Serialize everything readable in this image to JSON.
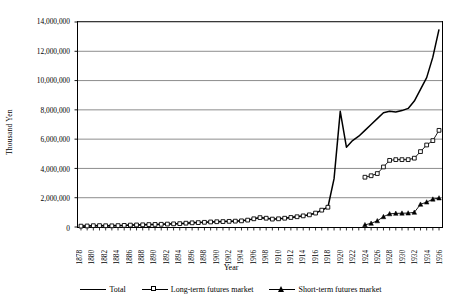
{
  "chart_data": {
    "type": "line",
    "title": "",
    "xlabel": "Year",
    "ylabel": "Thousand Yen",
    "ylim": [
      0,
      14000000
    ],
    "ytick_labels": [
      "0",
      "2,000,000",
      "4,000,000",
      "6,000,000",
      "8,000,000",
      "10,000,000",
      "12,000,000",
      "14,000,000"
    ],
    "ytick_values": [
      0,
      2000000,
      4000000,
      6000000,
      8000000,
      10000000,
      12000000,
      14000000
    ],
    "grid": true,
    "legend_position": "bottom",
    "xlim": [
      1878,
      1937
    ],
    "xtick_labels": [
      "1878",
      "1880",
      "1882",
      "1884",
      "1886",
      "1888",
      "1890",
      "1892",
      "1894",
      "1896",
      "1898",
      "1900",
      "1902",
      "1904",
      "1906",
      "1908",
      "1910",
      "1912",
      "1914",
      "1916",
      "1918",
      "1920",
      "1922",
      "1924",
      "1926",
      "1928",
      "1930",
      "1932",
      "1934",
      "1936"
    ],
    "x": [
      1878,
      1879,
      1880,
      1881,
      1882,
      1883,
      1884,
      1885,
      1886,
      1887,
      1888,
      1889,
      1890,
      1891,
      1892,
      1893,
      1894,
      1895,
      1896,
      1897,
      1898,
      1899,
      1900,
      1901,
      1902,
      1903,
      1904,
      1905,
      1906,
      1907,
      1908,
      1909,
      1910,
      1911,
      1912,
      1913,
      1914,
      1915,
      1916,
      1917,
      1918,
      1919,
      1920,
      1921,
      1922,
      1923,
      1924,
      1925,
      1926,
      1927,
      1928,
      1929,
      1930,
      1931,
      1932,
      1933,
      1934,
      1935,
      1936
    ],
    "series": [
      {
        "name": "Total",
        "marker": "none",
        "style": "solid-line",
        "values": [
          60000,
          70000,
          90000,
          95000,
          85000,
          80000,
          95000,
          110000,
          130000,
          140000,
          150000,
          165000,
          175000,
          185000,
          200000,
          215000,
          230000,
          260000,
          285000,
          300000,
          320000,
          345000,
          360000,
          370000,
          385000,
          400000,
          420000,
          470000,
          560000,
          640000,
          600000,
          540000,
          560000,
          600000,
          650000,
          700000,
          760000,
          830000,
          950000,
          1150000,
          1350000,
          3300000,
          7900000,
          5450000,
          5900000,
          6200000,
          6600000,
          7000000,
          7400000,
          7800000,
          7900000,
          7850000,
          7950000,
          8100000,
          8600000,
          9400000,
          10200000,
          11600000,
          13500000
        ]
      },
      {
        "name": "Long-term futures market",
        "marker": "open-square",
        "style": "line-marker",
        "values": [
          60000,
          70000,
          90000,
          95000,
          85000,
          80000,
          95000,
          110000,
          130000,
          140000,
          150000,
          165000,
          175000,
          185000,
          200000,
          215000,
          230000,
          260000,
          285000,
          300000,
          320000,
          345000,
          360000,
          370000,
          385000,
          400000,
          420000,
          470000,
          560000,
          640000,
          600000,
          540000,
          560000,
          600000,
          650000,
          700000,
          760000,
          830000,
          950000,
          1150000,
          1350000,
          null,
          null,
          null,
          null,
          null,
          3400000,
          3500000,
          3650000,
          4100000,
          4550000,
          4600000,
          4600000,
          4600000,
          4700000,
          5150000,
          5600000,
          5900000,
          6600000
        ]
      },
      {
        "name": "Short-term futures market",
        "marker": "filled-triangle",
        "style": "line-marker",
        "values": [
          null,
          null,
          null,
          null,
          null,
          null,
          null,
          null,
          null,
          null,
          null,
          null,
          null,
          null,
          null,
          null,
          null,
          null,
          null,
          null,
          null,
          null,
          null,
          null,
          null,
          null,
          null,
          null,
          null,
          null,
          null,
          null,
          null,
          null,
          null,
          null,
          null,
          null,
          null,
          null,
          null,
          null,
          null,
          null,
          null,
          null,
          150000,
          250000,
          420000,
          700000,
          900000,
          930000,
          940000,
          950000,
          1000000,
          1550000,
          1700000,
          1900000,
          1980000
        ]
      }
    ]
  },
  "legend": {
    "items": [
      {
        "label": "Total"
      },
      {
        "label": "Long-term futures market"
      },
      {
        "label": "Short-term futures market"
      }
    ]
  }
}
